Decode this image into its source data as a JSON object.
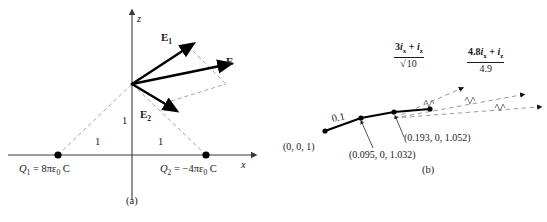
{
  "figure": {
    "panels": [
      {
        "caption": "(a)",
        "axes": {
          "x_label": "x",
          "z_label": "z"
        },
        "charges": [
          {
            "name": "Q1",
            "label": "Q₁ = 8πε₀ C",
            "symbol": "Q",
            "subscript": "1",
            "value_text": "= 8πε₀ C"
          },
          {
            "name": "Q2",
            "label": "Q₂ = −4πε₀ C",
            "symbol": "Q",
            "subscript": "2",
            "value_text": "= −4πε₀ C"
          }
        ],
        "distances": [
          {
            "name": "height",
            "label": "1"
          },
          {
            "name": "left-span",
            "label": "1"
          },
          {
            "name": "right-span",
            "label": "1"
          }
        ],
        "vectors": [
          {
            "name": "E1",
            "symbol": "E",
            "subscript": "1"
          },
          {
            "name": "E2",
            "symbol": "E",
            "subscript": "2"
          },
          {
            "name": "E",
            "symbol": "E",
            "subscript": ""
          }
        ]
      },
      {
        "caption": "(b)",
        "step_length": "0.1",
        "points": [
          {
            "label": "(0, 0, 1)"
          },
          {
            "label": "(0.095, 0, 1.032)"
          },
          {
            "label": "(0.193, 0, 1.052)"
          }
        ],
        "direction_labels": [
          {
            "name": "unit-vector-1",
            "numerator": "3iₓ + iᶻ",
            "numerator_coef": "3",
            "denominator": "√10",
            "text": "(3iₓ + iᶻ)/√10"
          },
          {
            "name": "unit-vector-2",
            "numerator": "4.8iₓ + iᶻ",
            "numerator_coef": "4.8",
            "denominator": "4.9",
            "text": "(4.8iₓ + iᶻ)/4.9"
          }
        ]
      }
    ],
    "colors": {
      "ink": "#1a1a1a",
      "axis": "#3a3a3a",
      "dashed": "#9a9a9a",
      "vector": "#000000",
      "background": "#ffffff"
    }
  }
}
